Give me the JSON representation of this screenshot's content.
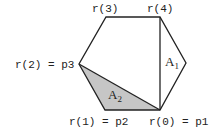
{
  "diagram": {
    "type": "hexagon-triangulation",
    "vertices": {
      "r0": {
        "label": "r(0) = p1",
        "x": 160,
        "y": 110
      },
      "r1": {
        "label": "r(1) = p2",
        "x": 105,
        "y": 110
      },
      "r2": {
        "label": "r(2) = p3",
        "x": 79,
        "y": 64
      },
      "r3": {
        "label": "r(3)",
        "x": 106,
        "y": 17
      },
      "r4": {
        "label": "r(4)",
        "x": 160,
        "y": 17
      },
      "r5": {
        "label": "",
        "x": 186,
        "y": 63
      }
    },
    "regions": {
      "a1": {
        "letter": "A",
        "sub": "1"
      },
      "a2": {
        "letter": "A",
        "sub": "2",
        "fill": "#c6c6c6"
      }
    },
    "colors": {
      "stroke": "#222222",
      "shade": "#c6c6c6",
      "background": "#ffffff"
    }
  }
}
